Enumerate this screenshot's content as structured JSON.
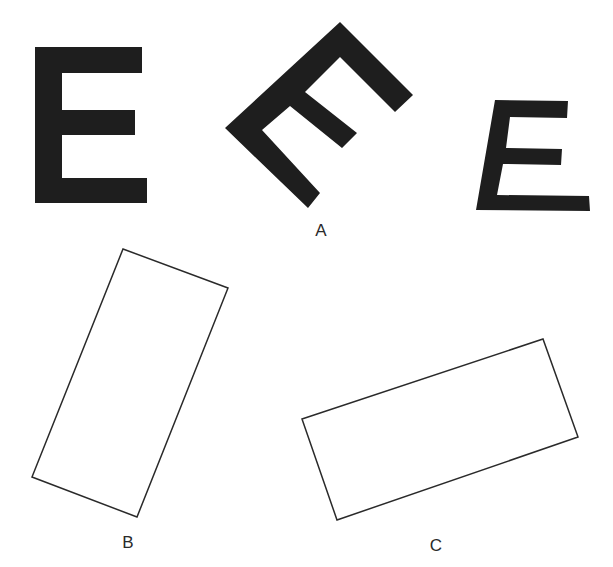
{
  "figure": {
    "background": "#ffffff",
    "glyph_color": "#1e1e1e",
    "outline_color": "#2a2a2a",
    "letters": [
      {
        "id": "e-upright",
        "glyph": "E",
        "orientation": "upright"
      },
      {
        "id": "e-rotated",
        "glyph": "E",
        "orientation": "rotated ~45° counter-clockwise"
      },
      {
        "id": "e-slanted",
        "glyph": "E",
        "orientation": "italic / sheared"
      }
    ],
    "rectangles": [
      {
        "id": "rect-b",
        "orientation": "tilted, tall"
      },
      {
        "id": "rect-c",
        "orientation": "tilted, wide"
      }
    ],
    "labels": {
      "a": "A",
      "b": "B",
      "c": "C"
    }
  }
}
